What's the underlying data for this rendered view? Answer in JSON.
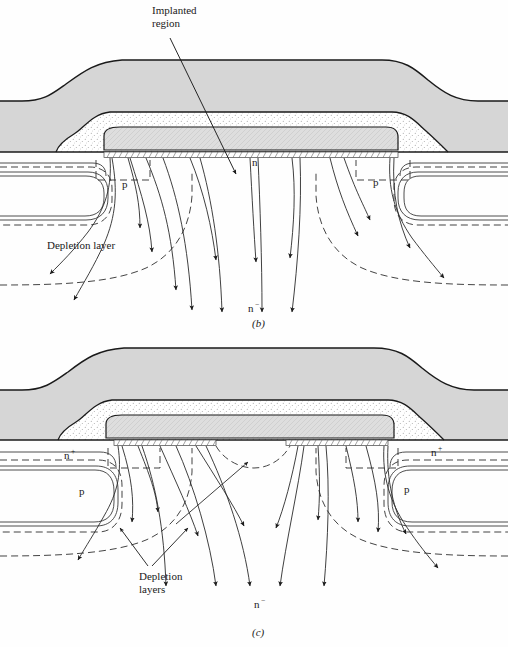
{
  "figure": {
    "type": "semiconductor-device-cross-section",
    "panels": [
      {
        "id": "b",
        "caption": "(b)",
        "caption_x": 258,
        "caption_y": 325,
        "annotations": [
          {
            "name": "implanted-region",
            "text_line1": "Implanted",
            "text_line2": "region",
            "x": 152,
            "y": 14,
            "leader_to_x": 236,
            "leader_to_y": 176
          },
          {
            "name": "n-region",
            "text": "n",
            "x": 252,
            "y": 166
          },
          {
            "name": "p-body-left",
            "text": "p",
            "x": 122,
            "y": 188
          },
          {
            "name": "p-body-right",
            "text": "p",
            "x": 373,
            "y": 186
          },
          {
            "name": "depletion-layer",
            "text": "Depletion layer",
            "x": 47,
            "y": 249
          },
          {
            "name": "n-minus-drift",
            "text": "n",
            "sup": "−",
            "x": 248,
            "y": 312
          }
        ]
      },
      {
        "id": "c",
        "caption": "(c)",
        "caption_x": 258,
        "caption_y": 634,
        "annotations": [
          {
            "name": "n-plus-source-left",
            "text": "n",
            "sup": "+",
            "x": 64,
            "y": 455
          },
          {
            "name": "n-plus-source-right",
            "text": "n",
            "sup": "+",
            "x": 431,
            "y": 452
          },
          {
            "name": "p-body-left",
            "text": "p",
            "x": 79,
            "y": 492
          },
          {
            "name": "p-body-right",
            "text": "p",
            "x": 404,
            "y": 490
          },
          {
            "name": "depletion-layers",
            "text_line1": "Depletion",
            "text_line2": "layers",
            "x": 139,
            "y": 577,
            "leader1_to_x": 139,
            "leader1_to_y": 533,
            "leader2_to_x": 186,
            "leader2_to_y": 527
          },
          {
            "name": "n-minus-drift",
            "text": "n",
            "sup": "−",
            "x": 254,
            "y": 606
          }
        ]
      }
    ],
    "colors": {
      "metal_fill": "#d6d6d6",
      "oxide_fill": "#ffffff",
      "gate_fill": "#dcdcdc",
      "stipple_dot": "#9a9a9a",
      "line": "#1a1a1a",
      "dashed_line": "#3a3a3a",
      "flow_line": "#2a2a2a",
      "background": "#fefefe"
    },
    "legend_semantics": {
      "solid_curves_with_arrowheads": "current flow lines",
      "dashed_curves": "depletion layer boundaries",
      "hatched_band": "inversion channel at surface",
      "gray_top_layer": "source metallization",
      "stippled_layer": "oxide / passivation",
      "inner_gray_block": "polysilicon gate"
    }
  }
}
